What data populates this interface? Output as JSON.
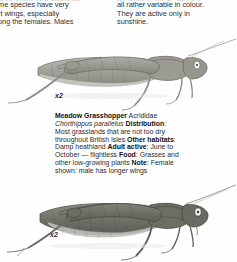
{
  "page": {
    "background_color": "#fefefe",
    "text_color": "#303030"
  },
  "body_text": {
    "left_column": {
      "clipped_top_line": "species and their wings are",
      "lines": [
        "ome species have very",
        "ort wings, especially",
        "nong the females. Males"
      ],
      "full_text": "ome species have very ort wings, especially nong the females. Males"
    },
    "right_column": {
      "clipped_top_line": "are longer. These species",
      "lines": [
        "all rather variable in colour.",
        "They are active only in",
        "sunshine."
      ],
      "full_text": "all rather variable in colour. They are active only in sunshine."
    }
  },
  "species_entry": {
    "common_name": "Meadow Grasshopper",
    "family": "Acrididae",
    "scientific_name": "Chorthippus parallelus",
    "fields": [
      {
        "label": "Distribution",
        "separator": ":",
        "value": "Most grasslands that are not too dry throughout British Isles"
      },
      {
        "label": "Other habitats",
        "separator": ":",
        "value": "Damp heathland"
      },
      {
        "label": "Adult active",
        "separator": ":",
        "value": "June to October — flightless"
      },
      {
        "label": "Food",
        "separator": ":",
        "value": "Grasses and other low-growing plants"
      },
      {
        "label": "Note",
        "separator": ":",
        "value": "Female shown: male has longer wings"
      }
    ]
  },
  "figures": [
    {
      "id": "figure-top",
      "magnification_label": "x2",
      "caption_subject": "meadow grasshopper female, light form",
      "orientation": "facing right",
      "body_color": "#9a9a94",
      "outline_color": "#6f6f69"
    },
    {
      "id": "figure-bottom",
      "magnification_label": "x2",
      "caption_subject": "meadow grasshopper female, dark form",
      "orientation": "facing right",
      "body_color": "#6e6e68",
      "outline_color": "#4a4a45"
    }
  ]
}
